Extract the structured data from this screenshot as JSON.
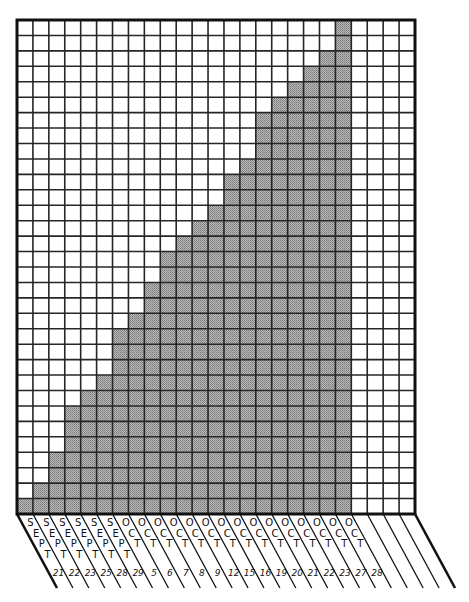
{
  "chart_data": {
    "type": "bar",
    "style": "hand-drawn cumulative bar chart on graph paper",
    "title": "",
    "xlabel": "",
    "ylabel": "",
    "grid": true,
    "grid_columns": 25,
    "grid_rows": 32,
    "ylim": [
      0,
      32
    ],
    "legend": null,
    "categories": [
      {
        "month": "SEPT",
        "day": "21"
      },
      {
        "month": "SEPT",
        "day": "22"
      },
      {
        "month": "SEPT",
        "day": "23"
      },
      {
        "month": "SEPT",
        "day": "25"
      },
      {
        "month": "SEPT",
        "day": "28"
      },
      {
        "month": "SEPT",
        "day": "29"
      },
      {
        "month": "OCT",
        "day": "5"
      },
      {
        "month": "OCT",
        "day": "6"
      },
      {
        "month": "OCT",
        "day": "7"
      },
      {
        "month": "OCT",
        "day": "8"
      },
      {
        "month": "OCT",
        "day": "9"
      },
      {
        "month": "OCT",
        "day": "12"
      },
      {
        "month": "OCT",
        "day": "15"
      },
      {
        "month": "OCT",
        "day": "16"
      },
      {
        "month": "OCT",
        "day": "19"
      },
      {
        "month": "OCT",
        "day": "20"
      },
      {
        "month": "OCT",
        "day": "21"
      },
      {
        "month": "OCT",
        "day": "22"
      },
      {
        "month": "OCT",
        "day": "23"
      },
      {
        "month": "OCT",
        "day": "27"
      },
      {
        "month": "OCT",
        "day": "28"
      }
    ],
    "values": [
      1,
      2,
      4,
      7,
      8,
      9,
      12,
      13,
      15,
      17,
      18,
      19,
      20,
      22,
      23,
      26,
      27,
      28,
      29,
      30,
      32
    ],
    "empty_trailing_columns": 4
  },
  "colors": {
    "fill": "#a3a3a3",
    "grid_line": "#262626",
    "border": "#111111",
    "background": "#ffffff"
  }
}
